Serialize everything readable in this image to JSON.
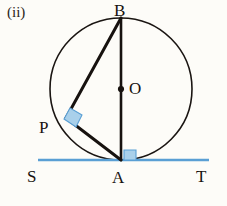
{
  "figure": {
    "part_label": "(ii)",
    "caption_points": [
      "B",
      "O",
      "P",
      "S",
      "A",
      "T"
    ],
    "background_color": "#fdfcf8",
    "stroke_color": "#171310",
    "tangent_color": "#5a9fd4",
    "right_angle_fill": "#a8cfe8",
    "right_angle_stroke": "#5a9fd4"
  },
  "labels": {
    "part": "(ii)",
    "B": "B",
    "O": "O",
    "P": "P",
    "S": "S",
    "A": "A",
    "T": "T"
  },
  "geometry": {
    "circle": {
      "cx": 121,
      "cy": 89,
      "r": 71,
      "stroke_width": 1.6
    },
    "center_dot": {
      "cx": 121,
      "cy": 89,
      "r": 3.1
    },
    "points": {
      "B": {
        "x": 121,
        "y": 18
      },
      "O": {
        "x": 121,
        "y": 89
      },
      "A": {
        "x": 121,
        "y": 160
      },
      "P": {
        "x": 66,
        "y": 118
      }
    },
    "segments": [
      {
        "name": "BA-diameter",
        "x1": 121,
        "y1": 18,
        "x2": 121,
        "y2": 160,
        "width": 2.6
      },
      {
        "name": "BP-chord",
        "x1": 121,
        "y1": 18,
        "x2": 66,
        "y2": 118,
        "width": 3.0
      },
      {
        "name": "PA-chord",
        "x1": 66,
        "y1": 118,
        "x2": 121,
        "y2": 160,
        "width": 3.0
      }
    ],
    "tangent": {
      "name": "SAT",
      "x1": 38,
      "y1": 160,
      "x2": 209,
      "y2": 160,
      "width": 2.6
    },
    "right_angles": [
      {
        "name": "right-angle-at-P",
        "points": "70,109 82,116 75,127 63,120"
      },
      {
        "name": "right-angle-at-A",
        "points": "124,150 136,150 136,160 124,160"
      }
    ]
  }
}
